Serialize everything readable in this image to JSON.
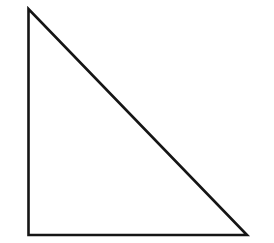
{
  "diagram": {
    "shape": "right-triangle",
    "stroke_color": "#151515",
    "fill_color": "#ffffff",
    "stroke_width": 2.6,
    "vertices": {
      "top": [
        28.5,
        9
      ],
      "bottom_left": [
        28.5,
        235
      ],
      "bottom_right": [
        247,
        235
      ]
    }
  }
}
